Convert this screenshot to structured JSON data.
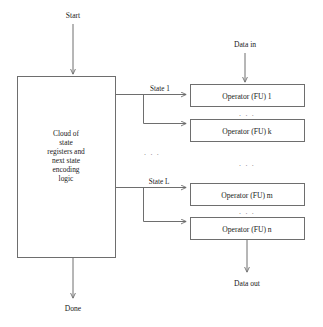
{
  "diagram": {
    "signals": {
      "start": "Start",
      "done": "Done",
      "data_in": "Data in",
      "data_out": "Data out",
      "state_first": "State 1",
      "state_last": "State L"
    },
    "control_block": {
      "name": "state-register-cloud",
      "lines": [
        "Cloud of",
        "state",
        "registers and",
        "next state",
        "encoding",
        "logic"
      ]
    },
    "operators": [
      {
        "label": "Operator (FU) 1",
        "key": "op-1"
      },
      {
        "label": "Operator (FU) k",
        "key": "op-k"
      },
      {
        "label": "Operator (FU) m",
        "key": "op-m"
      },
      {
        "label": "Operator (FU) n",
        "key": "op-n"
      }
    ],
    "ellipses": {
      "between_op1_opk": ". . .",
      "between_opk_opm": ". . .",
      "between_opm_opn": ". . .",
      "between_states": ". . ."
    },
    "caption": "",
    "colors": {
      "stroke": "#6e6e6e",
      "text": "#1a1a1a",
      "background": "#ffffff",
      "ellipsis": "#7a7a7a"
    }
  }
}
